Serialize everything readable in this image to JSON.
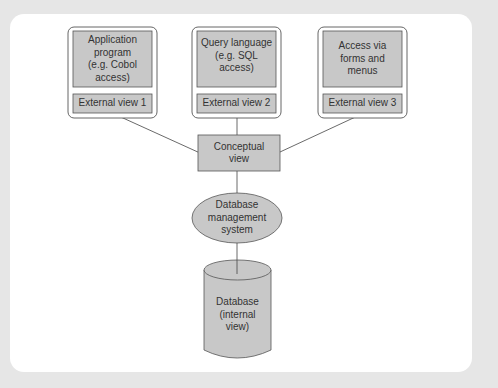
{
  "diagram": {
    "title": "",
    "external_boxes": [
      {
        "program": "Application program (e.g. Cobol access)",
        "program_lines": [
          "Application",
          "program",
          "(e.g. Cobol",
          "access)"
        ],
        "view": "External view 1"
      },
      {
        "program": "Query language (e.g. SQL access)",
        "program_lines": [
          "Query language",
          "(e.g. SQL",
          "access)"
        ],
        "view": "External view 2"
      },
      {
        "program": "Access via forms and menus",
        "program_lines": [
          "Access via",
          "forms and",
          "menus"
        ],
        "view": "External view 3"
      }
    ],
    "conceptual": {
      "lines": [
        "Conceptual",
        "view"
      ]
    },
    "dbms": {
      "lines": [
        "Database",
        "management",
        "system"
      ]
    },
    "database": {
      "lines": [
        "Database",
        "(internal",
        "view)"
      ]
    },
    "colors": {
      "box_fill": "#c8c8c8",
      "stroke": "#555555",
      "background": "#e6e6e6",
      "card": "#ffffff"
    }
  }
}
